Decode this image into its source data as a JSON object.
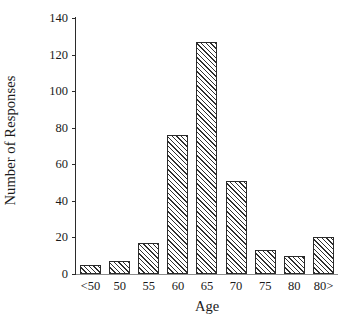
{
  "chart_data": {
    "type": "bar",
    "title": "",
    "subtitle": "",
    "xlabel": "Age",
    "ylabel": "Number of Responses",
    "categories": [
      "<50",
      "50",
      "55",
      "60",
      "65",
      "70",
      "75",
      "80",
      "80>"
    ],
    "values": [
      5,
      7,
      17,
      76,
      127,
      51,
      13,
      10,
      20
    ],
    "series": [
      {
        "name": "Number of Responses",
        "values": [
          5,
          7,
          17,
          76,
          127,
          51,
          13,
          10,
          20
        ]
      }
    ],
    "ylim": [
      0,
      140
    ],
    "ytick_labels": [
      "0",
      "20",
      "40",
      "60",
      "80",
      "100",
      "120",
      "140"
    ],
    "ytick_values": [
      0,
      20,
      40,
      60,
      80,
      100,
      120,
      140
    ],
    "grid": false,
    "legend": false,
    "legend_position": "none",
    "bar_fill": "diagonal-hatch",
    "bar_edge_color": "#2b2b2b",
    "bar_hatch_color": "#2f2f2f",
    "background_color": "#ffffff",
    "axis_color": "#2b2b2b"
  }
}
